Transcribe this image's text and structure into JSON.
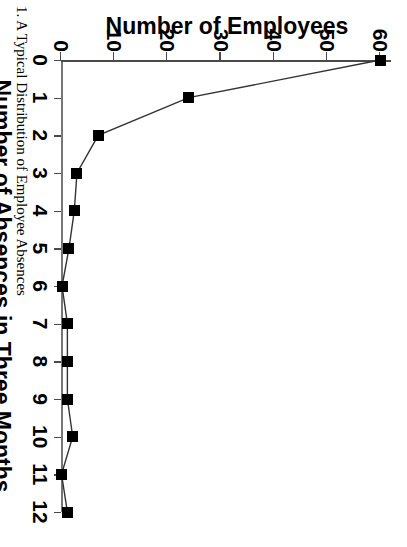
{
  "figure": {
    "caption": "1. A Typical Distribution of Employee Absences"
  },
  "chart_data": {
    "type": "line",
    "title": "",
    "xlabel": "Number of Absences in Three Months",
    "ylabel": "Number of Employees",
    "x": [
      0,
      1,
      2,
      3,
      4,
      5,
      6,
      7,
      8,
      9,
      10,
      11,
      12
    ],
    "values": [
      60,
      24,
      7,
      3,
      2.5,
      1.5,
      0.2,
      1.2,
      1.2,
      1.2,
      2.2,
      0.1,
      1.2
    ],
    "series": [
      {
        "name": "Number of Employees",
        "values": [
          60,
          24,
          7,
          3,
          2.5,
          1.5,
          0.2,
          1.2,
          1.2,
          1.2,
          2.2,
          0.1,
          1.2
        ]
      }
    ],
    "xticks": [
      "0",
      "1",
      "2",
      "3",
      "4",
      "5",
      "6",
      "7",
      "8",
      "9",
      "10",
      "11",
      "12"
    ],
    "yticks": [
      "0",
      "10",
      "20",
      "30",
      "40",
      "50",
      "60"
    ],
    "xlim": [
      0,
      12
    ],
    "ylim": [
      0,
      62
    ],
    "grid": false,
    "legend": false,
    "marker": "filled-square",
    "line_color": "#333333",
    "marker_color": "#000000",
    "rotation_note": "figure printed sideways"
  }
}
